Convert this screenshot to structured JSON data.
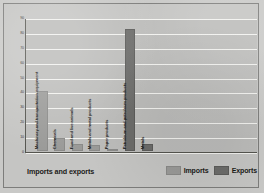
{
  "chart_data": {
    "type": "bar",
    "title": "",
    "xlabel": "Imports and exports",
    "ylabel": "Percentage of total",
    "ylim": [
      0,
      90
    ],
    "ytick_step": 10,
    "yticks": [
      "0",
      "10",
      "20",
      "30",
      "40",
      "50",
      "60",
      "70",
      "80",
      "90"
    ],
    "grid": true,
    "legend_position": "bottom-right",
    "categories": [
      "Machinery and transportation equipment",
      "Chemicals",
      "Food and live animals",
      "Metals and metal products",
      "Paper products",
      "Petroleum and petroleum products",
      "Metals"
    ],
    "series": [
      {
        "name": "Imports",
        "color": "#9a9a98",
        "values": [
          40,
          9,
          5,
          4,
          1,
          null,
          null
        ]
      },
      {
        "name": "Exports",
        "color": "#6c6c6a",
        "values": [
          null,
          null,
          null,
          null,
          null,
          82,
          5
        ]
      }
    ],
    "bars": [
      {
        "category": "Machinery and transportation equipment",
        "series": "Imports",
        "value": 40
      },
      {
        "category": "Chemicals",
        "series": "Imports",
        "value": 9
      },
      {
        "category": "Food and live animals",
        "series": "Imports",
        "value": 5
      },
      {
        "category": "Metals and metal products",
        "series": "Imports",
        "value": 4
      },
      {
        "category": "Paper products",
        "series": "Imports",
        "value": 1
      },
      {
        "category": "Petroleum and petroleum products",
        "series": "Exports",
        "value": 82
      },
      {
        "category": "Metals",
        "series": "Exports",
        "value": 5
      }
    ]
  },
  "legend": {
    "items": [
      {
        "label": "Imports",
        "key": "imports"
      },
      {
        "label": "Exports",
        "key": "exports"
      }
    ]
  },
  "colors": {
    "background": "#c9c9c7",
    "plot_background": "#bcbcba",
    "gridline": "#f2f2ef",
    "axis": "#55554f",
    "imports": "#9a9a98",
    "exports": "#6c6c6a",
    "text": "#1b1b18"
  }
}
